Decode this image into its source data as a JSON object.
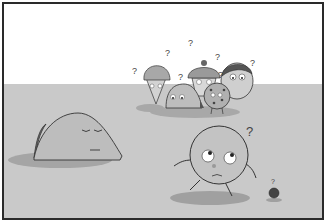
{
  "scene": {
    "type": "comic-panel-illustration",
    "style": "grayscale pencil illustration",
    "colors": {
      "sky": "#ffffff",
      "ground": "#c9c9c9",
      "border": "#2a2a2a",
      "shadow": "#9a9a9a",
      "character_fill": "#bdbdbd"
    },
    "question_mark": "?",
    "characters": [
      {
        "name": "sleeping-taco-lump",
        "description": "large sleeping taco-shaped blob with closed eyes"
      },
      {
        "name": "ice-cream-cone",
        "description": "ice cream cone character, confused"
      },
      {
        "name": "taco",
        "description": "small taco character with big eyes"
      },
      {
        "name": "cupcake",
        "description": "cupcake character with cherry on top"
      },
      {
        "name": "cookie",
        "description": "chocolate chip cookie character"
      },
      {
        "name": "egg-face",
        "description": "round character with hair"
      },
      {
        "name": "round-walker",
        "description": "large round ball character walking, looking up worried"
      },
      {
        "name": "blueberry",
        "description": "tiny dark round character"
      }
    ]
  }
}
